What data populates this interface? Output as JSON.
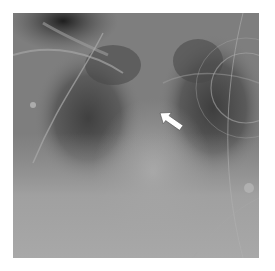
{
  "image": {
    "kind": "chest radiograph",
    "annotation": {
      "type": "arrow",
      "color": "#ffffff",
      "direction": "pointing up-left",
      "target": "upper mediastinum / right paratracheal region"
    },
    "colors": {
      "border": "#ffffff",
      "lung_dark": "#4a4a4a",
      "soft_tissue": "#9a9a9a",
      "lower_opacity": "#a8a8a8"
    }
  }
}
